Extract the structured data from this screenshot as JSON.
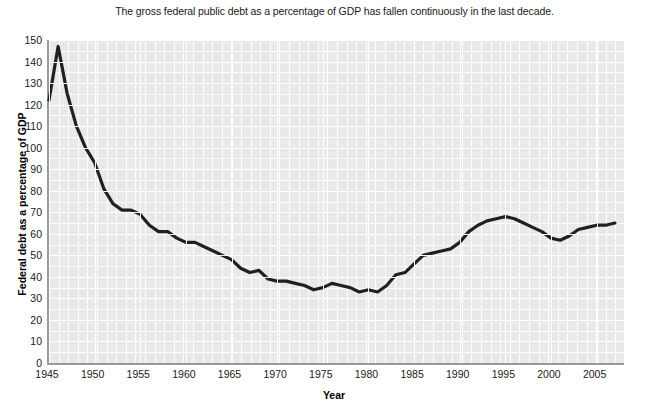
{
  "chart_data": {
    "type": "line",
    "title": "The gross federal public debt as a percentage of GDP has fallen continuously in the last decade.",
    "xlabel": "Year",
    "ylabel": "Federal debt as a percentage of GDP",
    "xlim": [
      1945,
      2008
    ],
    "ylim": [
      0,
      150
    ],
    "grid": true,
    "legend": null,
    "line_color": "#231f20",
    "plot_background": "#e9e9e9",
    "gridline_color": "#ffffff",
    "axis_color": "#9a9a9a",
    "y_ticks": [
      0,
      10,
      20,
      30,
      40,
      50,
      60,
      70,
      80,
      90,
      100,
      110,
      120,
      130,
      140,
      150
    ],
    "x_ticks": [
      1945,
      1950,
      1955,
      1960,
      1965,
      1970,
      1975,
      1980,
      1985,
      1990,
      1995,
      2000,
      2005
    ],
    "x": [
      1945,
      1946,
      1947,
      1948,
      1949,
      1950,
      1951,
      1952,
      1953,
      1954,
      1955,
      1956,
      1957,
      1958,
      1959,
      1960,
      1961,
      1962,
      1963,
      1964,
      1965,
      1966,
      1967,
      1968,
      1969,
      1970,
      1971,
      1972,
      1973,
      1974,
      1975,
      1976,
      1977,
      1978,
      1979,
      1980,
      1981,
      1982,
      1983,
      1984,
      1985,
      1986,
      1987,
      1988,
      1989,
      1990,
      1991,
      1992,
      1993,
      1994,
      1995,
      1996,
      1997,
      1998,
      1999,
      2000,
      2001,
      2002,
      2003,
      2004,
      2005,
      2006,
      2007
    ],
    "values": [
      122,
      147,
      125,
      110,
      100,
      93,
      81,
      74,
      71,
      71,
      69,
      64,
      61,
      61,
      58,
      56,
      56,
      54,
      52,
      50,
      48,
      44,
      42,
      43,
      39,
      38,
      38,
      37,
      36,
      34,
      35,
      37,
      36,
      35,
      33,
      34,
      33,
      36,
      41,
      42,
      46,
      50,
      51,
      52,
      53,
      56,
      61,
      64,
      66,
      67,
      68,
      67,
      65,
      63,
      61,
      58,
      57,
      59,
      62,
      63,
      64,
      64,
      65
    ],
    "annotations": {
      "peak_year": 1946,
      "peak_value": 147,
      "trough_year": 1974,
      "trough_value": 32,
      "secondary_peak_year": 1996,
      "secondary_peak_value": 78,
      "final_year": 2007,
      "final_value": 38
    },
    "series_pixel_path": "M 0,48 L 9.1,15 L 18.3,52 L 27.4,85 L 36.6,104 L 45.7,119 L 54.9,147 L 64,157 L 73.1,163 L 82.3,160 L 91.4,177 L 100.6,190 L 109.7,196 L 118.9,197 L 128,199 L 137.1,202 L 146.3,201 L 155.4,202 L 164.6,203 L 173.7,203 L 182.9,208 L 192,219 L 201.1,222 L 210.3,220 L 219.4,230 L 228.6,232 L 237.7,233 L 246.9,237 L 256,241 L 265.1,246 L 274.3,246 L 283.4,245 L 292.6,243 L 301.7,243 L 310.9,242 L 320,241 L 329.1,241 L 338.3,236 L 347.4,224 L 356.6,214 L 365.7,203 L 374.9,194 L 384,190 L 393.1,187 L 402.3,186 L 411.4,183 L 420.6,176 L 429.7,170 L 438.9,171 L 448,172 L 457.1,174 L 466.3,195 L 475.4,212 L 484.6,225 L 493.7,232 L 502.9,238 L 512,242 L 521.1,246 L 530.3,250 L 539.4,253 L 548.6,256 L 557.7,260 L 566.9,264"
  }
}
